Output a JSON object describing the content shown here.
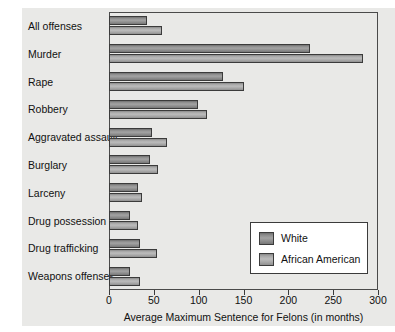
{
  "chart_data": {
    "type": "bar",
    "orientation": "horizontal",
    "title": "",
    "xlabel": "Average Maximum Sentence for Felons (in months)",
    "ylabel": "",
    "xlim": [
      0,
      300
    ],
    "xticks": [
      0,
      50,
      100,
      150,
      200,
      250,
      300
    ],
    "grid": false,
    "legend_position": "bottom-right",
    "categories": [
      "All offenses",
      "Murder",
      "Rape",
      "Robbery",
      "Aggravated assault",
      "Burglary",
      "Larceny",
      "Drug possession",
      "Drug trafficking",
      "Weapons offenses"
    ],
    "series": [
      {
        "name": "White",
        "color": "#8f8f8f",
        "values": [
          42,
          224,
          127,
          99,
          48,
          46,
          32,
          23,
          35,
          23
        ]
      },
      {
        "name": "African American",
        "color": "#b4b4b4",
        "values": [
          59,
          283,
          150,
          109,
          65,
          55,
          37,
          32,
          54,
          35
        ]
      }
    ]
  },
  "legend": {
    "items": [
      {
        "label": "White"
      },
      {
        "label": "African American"
      }
    ]
  },
  "colors": {
    "figure_background": "#e9e9e7",
    "page_background": "#ffffff",
    "axis": "#3b3b3b",
    "text": "#111111"
  }
}
